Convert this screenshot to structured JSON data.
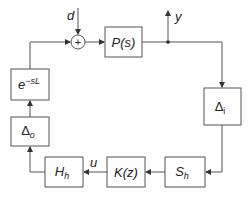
{
  "diagram": {
    "type": "feedback control block diagram",
    "signals": {
      "disturbance": "d",
      "output": "y",
      "control": "u"
    },
    "sum_junction": {
      "symbol": "+"
    },
    "blocks": [
      {
        "id": "plant",
        "label": "P(s)"
      },
      {
        "id": "delta_i",
        "label_main": "Δ",
        "label_sub": "i"
      },
      {
        "id": "sampler",
        "label_main": "S",
        "label_sub": "h"
      },
      {
        "id": "controller",
        "label": "K(z)"
      },
      {
        "id": "hold",
        "label_main": "H",
        "label_sub": "h"
      },
      {
        "id": "delta_o",
        "label_main": "Δ",
        "label_sub": "o"
      },
      {
        "id": "delay",
        "label_main": "e",
        "label_sup": "−sL"
      }
    ],
    "colors": {
      "line": "#555555",
      "text": "#222222",
      "background": "#ffffff"
    }
  }
}
